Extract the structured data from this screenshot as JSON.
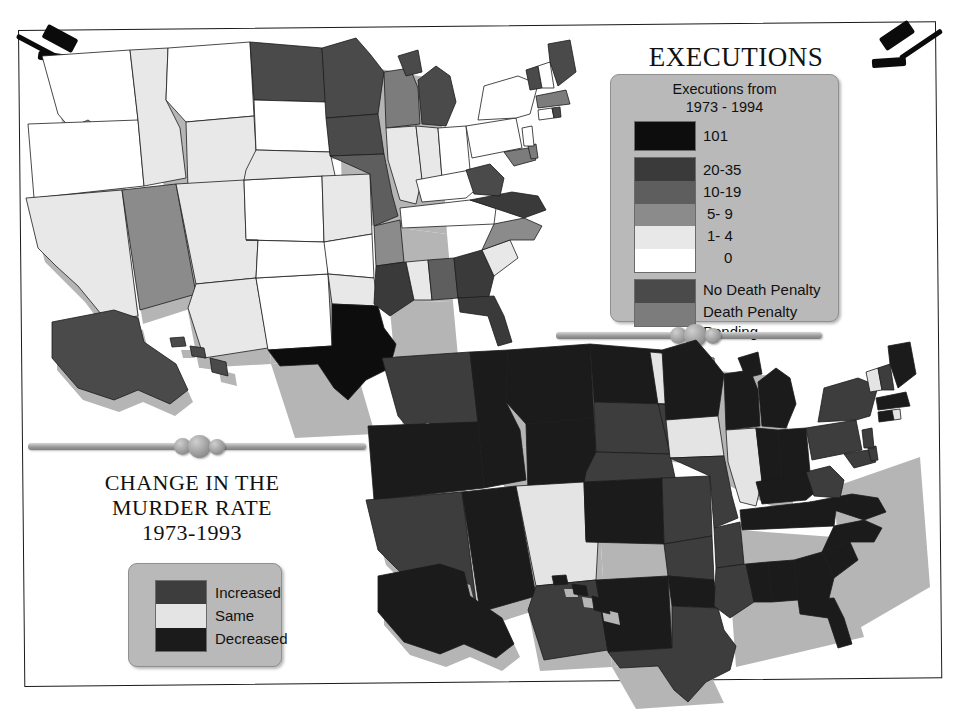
{
  "frame": {
    "border_color": "#1a1a1a",
    "background": "#ffffff"
  },
  "decorations": {
    "gavel_left": "gavel-icon",
    "gavel_right": "gavel-icon",
    "divider_upper": "ornamental-divider",
    "divider_lower": "ornamental-divider"
  },
  "executions_panel": {
    "title": "EXECUTIONS",
    "legend": {
      "caption_line1": "Executions from",
      "caption_line2": "1973 - 1994",
      "items": [
        {
          "label": "101",
          "color": "#0d0d0d"
        },
        {
          "label": "20-35",
          "color": "#3a3a3a"
        },
        {
          "label": "10-19",
          "color": "#5e5e5e"
        },
        {
          "label": "5- 9",
          "color": "#8b8b8b"
        },
        {
          "label": "1- 4",
          "color": "#e8e8e8"
        },
        {
          "label": "0",
          "color": "#ffffff"
        }
      ],
      "status_items": [
        {
          "label": "No Death Penalty",
          "color": "#4a4a4a"
        },
        {
          "label": "Death Penalty Pending",
          "label_line1": "Death Penalty",
          "label_line2": "Pending",
          "color": "#7c7c7c"
        }
      ]
    }
  },
  "murder_panel": {
    "title_line1": "CHANGE IN THE",
    "title_line2": "MURDER RATE",
    "title_line3": "1973-1993",
    "legend": {
      "items": [
        {
          "label": "Increased",
          "color": "#3d3d3d"
        },
        {
          "label": "Same",
          "color": "#e4e4e4"
        },
        {
          "label": "Decreased",
          "color": "#1b1b1b"
        }
      ]
    }
  },
  "map_data": {
    "executions_map": {
      "title": "EXECUTIONS",
      "period": "1973 - 1994",
      "categories": [
        "101",
        "20-35",
        "10-19",
        "5- 9",
        "1- 4",
        "0",
        "No Death Penalty",
        "Death Penalty Pending"
      ],
      "states": {
        "WA": "0",
        "OR": "0",
        "CA": "1- 4",
        "NV": "5- 9",
        "ID": "1- 4",
        "MT": "0",
        "WY": "1- 4",
        "UT": "1- 4",
        "AZ": "1- 4",
        "CO": "0",
        "NM": "0",
        "ND": "No Death Penalty",
        "SD": "0",
        "NE": "1- 4",
        "KS": "0",
        "OK": "1- 4",
        "TX": "101",
        "MN": "No Death Penalty",
        "IA": "No Death Penalty",
        "MO": "10-19",
        "AR": "5- 9",
        "LA": "20-35",
        "WI": "Death Penalty Pending",
        "IL": "1- 4",
        "MS": "1- 4",
        "AL": "10-19",
        "MI": "No Death Penalty",
        "IN": "1- 4",
        "KY": "0",
        "TN": "0",
        "OH": "0",
        "GA": "20-35",
        "FL": "20-35",
        "SC": "1- 4",
        "NC": "5- 9",
        "VA": "20-35",
        "WV": "No Death Penalty",
        "PA": "0",
        "NY": "0",
        "MD": "Death Penalty Pending",
        "DE": "Death Penalty Pending",
        "NJ": "0",
        "CT": "0",
        "RI": "No Death Penalty",
        "MA": "No Death Penalty",
        "VT": "No Death Penalty",
        "NH": "0",
        "ME": "No Death Penalty",
        "AK": "No Death Penalty",
        "HI": "No Death Penalty"
      }
    },
    "murder_rate_map": {
      "title": "CHANGE IN THE MURDER RATE",
      "period": "1973-1993",
      "categories": [
        "Increased",
        "Same",
        "Decreased"
      ],
      "states": {
        "WA": "Increased",
        "OR": "Decreased",
        "CA": "Increased",
        "NV": "Decreased",
        "ID": "Decreased",
        "MT": "Decreased",
        "WY": "Decreased",
        "UT": "Same",
        "AZ": "Increased",
        "CO": "Decreased",
        "NM": "Decreased",
        "ND": "Same",
        "SD": "Increased",
        "NE": "Increased",
        "KS": "Increased",
        "OK": "Decreased",
        "TX": "Increased",
        "MN": "Decreased",
        "IA": "Same",
        "MO": "Increased",
        "AR": "Increased",
        "LA": "Increased",
        "WI": "Decreased",
        "IL": "Same",
        "MS": "Decreased",
        "AL": "Decreased",
        "MI": "Decreased",
        "IN": "Decreased",
        "KY": "Decreased",
        "TN": "Decreased",
        "OH": "Decreased",
        "GA": "Decreased",
        "FL": "Decreased",
        "SC": "Decreased",
        "NC": "Decreased",
        "VA": "Decreased",
        "WV": "Increased",
        "PA": "Increased",
        "NY": "Increased",
        "MD": "Increased",
        "DE": "Increased",
        "NJ": "Increased",
        "CT": "Decreased",
        "RI": "Same",
        "MA": "Decreased",
        "VT": "Same",
        "NH": "Increased",
        "ME": "Decreased",
        "AK": "Decreased",
        "HI": "Decreased"
      }
    }
  }
}
